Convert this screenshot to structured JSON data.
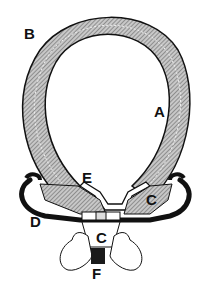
{
  "diagram": {
    "type": "cross-section",
    "labels": {
      "A": "A",
      "B": "B",
      "C_right": "C",
      "C_bottom": "C",
      "D": "D",
      "E": "E",
      "F": "F"
    },
    "colors": {
      "ink": "#111111",
      "hatch": "#9a9a9a",
      "paper": "#ffffff"
    }
  }
}
